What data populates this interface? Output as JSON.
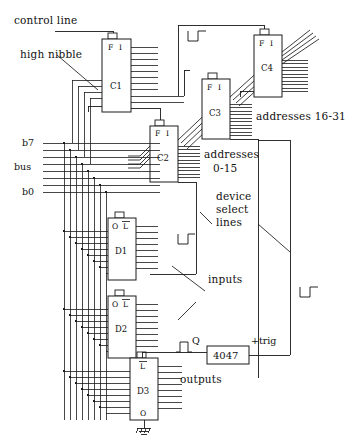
{
  "diagram": {
    "type": "electronic-schematic"
  },
  "annotations": {
    "control_line": "control line",
    "high_nibble": "high nibble",
    "addresses_16_31": "addresses 16-31",
    "addresses_0_15_line1": "addresses",
    "addresses_0_15_line2": "0-15",
    "device_select_line1": "device",
    "device_select_line2": "select",
    "device_select_line3": "lines",
    "inputs": "inputs",
    "outputs": "outputs"
  },
  "bus": {
    "top_label": "b7",
    "name_label": "bus",
    "bottom_label": "b0",
    "line_count": 8
  },
  "chips": {
    "c1": {
      "name": "C1",
      "pin_left": "F",
      "pin_right": "I"
    },
    "c2": {
      "name": "C2",
      "pin_left": "F",
      "pin_right": "I"
    },
    "c3": {
      "name": "C3",
      "pin_left": "F",
      "pin_right": "I"
    },
    "c4": {
      "name": "C4",
      "pin_left": "F",
      "pin_right": "I"
    },
    "d1": {
      "name": "D1",
      "pin_left": "O",
      "pin_right": "L"
    },
    "d2": {
      "name": "D2",
      "pin_left": "O",
      "pin_right": "L"
    },
    "d3": {
      "name": "D3",
      "pin_top": "L",
      "pin_bottom": "O"
    },
    "timer": {
      "name": "4047",
      "output_label": "Q",
      "trigger_label": "+trig"
    }
  },
  "colors": {
    "ink": "#1a1a1a",
    "background": "#ffffff"
  }
}
